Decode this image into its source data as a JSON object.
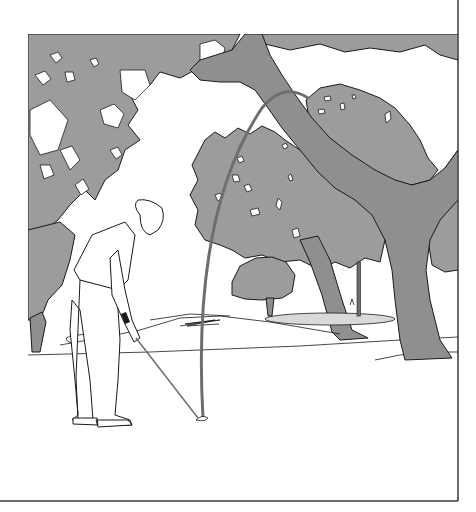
{
  "illustration": {
    "subject": "golfer hitting a high shot over trees toward a green",
    "colors": {
      "background": "#ffffff",
      "foliage": "#9c9c9c",
      "trunk": "#8f8f8f",
      "outline": "#1a1a1a",
      "ball_flight": "#6e6e6e",
      "green": "#d9d9d9",
      "border": "#3a3a3a"
    },
    "panel": {
      "left": 28,
      "top": 34,
      "right": 458,
      "bottom": 501
    },
    "ball_flight": {
      "start": [
        203,
        418
      ],
      "apex": [
        288,
        95
      ],
      "label": "ball-flight-arc"
    },
    "flagstick": {
      "x": 359,
      "top": 262,
      "bottom": 316
    },
    "golfer": {
      "position": [
        105,
        300
      ],
      "stance": "address"
    },
    "trees": [
      "left-canopy",
      "center-tree",
      "large-oak",
      "distant-tree",
      "right-tree"
    ]
  }
}
